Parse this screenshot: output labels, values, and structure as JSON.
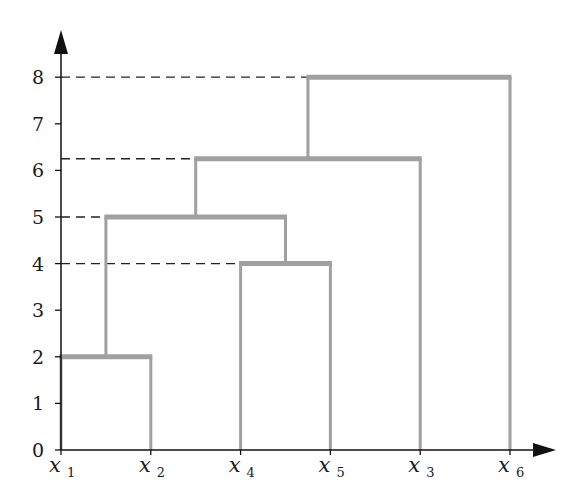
{
  "chart_data": {
    "type": "dendrogram",
    "title": "",
    "xlabel": "",
    "ylabel": "",
    "ylim": [
      0,
      8.5
    ],
    "yticks": [
      "0",
      "1",
      "2",
      "3",
      "4",
      "5",
      "6",
      "7",
      "8"
    ],
    "leaves": [
      {
        "name": "x",
        "sub": "1"
      },
      {
        "name": "x",
        "sub": "2"
      },
      {
        "name": "x",
        "sub": "4"
      },
      {
        "name": "x",
        "sub": "5"
      },
      {
        "name": "x",
        "sub": "3"
      },
      {
        "name": "x",
        "sub": "6"
      }
    ],
    "leaf_order": [
      "x1",
      "x2",
      "x4",
      "x5",
      "x3",
      "x6"
    ],
    "merges": [
      {
        "clusters": [
          "x1",
          "x2"
        ],
        "height": 2
      },
      {
        "clusters": [
          "x4",
          "x5"
        ],
        "height": 4
      },
      {
        "clusters": [
          "{x1,x2}",
          "{x4,x5}"
        ],
        "height": 5
      },
      {
        "clusters": [
          "{x1,x2,x4,x5}",
          "x3"
        ],
        "height": 6.25
      },
      {
        "clusters": [
          "{x1,x2,x4,x5,x3}",
          "x6"
        ],
        "height": 8
      }
    ],
    "dashed_reference_lines": [
      8,
      6.25,
      5,
      4
    ],
    "grid": false,
    "legend": null
  },
  "colors": {
    "branch": "#a0a0a0",
    "axis": "#111111",
    "dash": "#222222",
    "background": "#ffffff"
  }
}
